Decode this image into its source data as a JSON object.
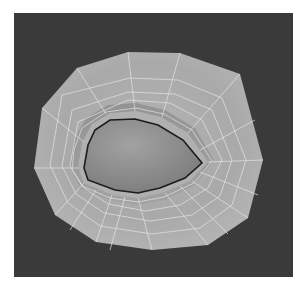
{
  "scene": {
    "subject": "eye socket polygon mesh render",
    "background_color": "#3a3a3a",
    "page_color": "#ffffff",
    "mesh_color": "#a8a8a8",
    "wire_color": "#e6e6e6",
    "opening_color": "#8e8e8e"
  }
}
